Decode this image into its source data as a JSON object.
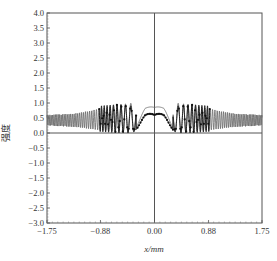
{
  "chart_data": {
    "type": "line",
    "title": "",
    "xlabel": "x/mm",
    "ylabel": "强度",
    "xlim": [
      -1.75,
      1.75
    ],
    "ylim": [
      -3.0,
      4.0
    ],
    "xticks": [
      "-1.75",
      "-0.88",
      "0.00",
      "0.88",
      "1.75"
    ],
    "yticks": [
      "4.0",
      "3.5",
      "3.0",
      "2.5",
      "2.0",
      "1.5",
      "1.0",
      "0.5",
      "0.0",
      "-0.5",
      "-1.0",
      "-1.5",
      "-2.0",
      "-2.5",
      "-3.0"
    ],
    "grid": false,
    "reference_lines": {
      "horizontal": 0.0,
      "vertical": 0.0
    },
    "series": [
      {
        "name": "outer-oscillation",
        "style": "thin solid line",
        "description": "Rapid oscillation between ~0.2 and ~0.65 at |x|>0.9, growing amplitude toward center; central hump peak ~0.95 at x≈±0.15 with a dip ~0.85 at x=0",
        "envelope_x": [
          -1.75,
          -1.3,
          -0.9,
          -0.6,
          -0.35,
          -0.15,
          0.0,
          0.15,
          0.35,
          0.6,
          0.9,
          1.3,
          1.75
        ],
        "envelope_max": [
          0.6,
          0.65,
          0.8,
          0.95,
          1.0,
          0.95,
          0.85,
          0.95,
          1.0,
          0.95,
          0.8,
          0.65,
          0.6
        ],
        "envelope_min": [
          0.25,
          0.2,
          0.1,
          0.05,
          0.0,
          0.7,
          0.65,
          0.7,
          0.0,
          0.05,
          0.1,
          0.2,
          0.25
        ]
      },
      {
        "name": "inner-marked",
        "style": "solid line with dot markers",
        "description": "Confined to |x|<0.9; oscillations 0-0.95, central hump peak ~0.75 at x≈±0.15, ~0.6 at x=0",
        "envelope_x": [
          -0.9,
          -0.6,
          -0.35,
          -0.15,
          0.0,
          0.15,
          0.35,
          0.6,
          0.9
        ],
        "envelope_max": [
          0.9,
          0.95,
          0.9,
          0.75,
          0.6,
          0.75,
          0.9,
          0.95,
          0.9
        ],
        "envelope_min": [
          0.05,
          0.0,
          0.0,
          0.45,
          0.4,
          0.45,
          0.0,
          0.0,
          0.05
        ]
      }
    ]
  }
}
